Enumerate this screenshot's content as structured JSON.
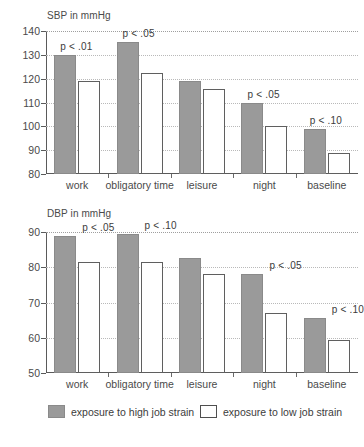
{
  "legend": {
    "high_label": "exposure to high job strain",
    "low_label": "exposure to low job strain",
    "high_color": "#9a9a9a",
    "low_color": "#ffffff",
    "position": "bottom"
  },
  "chart_data": [
    {
      "type": "bar",
      "title": "SBP in mmHg",
      "xlabel": "",
      "ylabel": "SBP in mmHg",
      "ylim": [
        80,
        140
      ],
      "yticks": [
        80,
        90,
        100,
        110,
        120,
        130,
        140
      ],
      "ytick_labels": [
        "80",
        "90",
        "100",
        "110",
        "120",
        "130",
        "140"
      ],
      "grid": true,
      "categories": [
        "work",
        "obligatory time",
        "leisure",
        "night",
        "baseline"
      ],
      "series": [
        {
          "name": "exposure to high job strain",
          "values": [
            130,
            135.5,
            119,
            110,
            99
          ]
        },
        {
          "name": "exposure to low job strain",
          "values": [
            119,
            122.5,
            115.5,
            100,
            89
          ]
        }
      ],
      "annotations": [
        {
          "category": "work",
          "text": "p < .01"
        },
        {
          "category": "obligatory time",
          "text": "p < .05"
        },
        {
          "category": "leisure",
          "text": ""
        },
        {
          "category": "night",
          "text": "p < .05"
        },
        {
          "category": "baseline",
          "text": "p < .10"
        }
      ]
    },
    {
      "type": "bar",
      "title": "DBP in mmHg",
      "xlabel": "",
      "ylabel": "DBP in mmHg",
      "ylim": [
        50,
        90
      ],
      "yticks": [
        50,
        60,
        70,
        80,
        90
      ],
      "ytick_labels": [
        "50",
        "60",
        "70",
        "80",
        "90"
      ],
      "grid": true,
      "categories": [
        "work",
        "obligatory time",
        "leisure",
        "night",
        "baseline"
      ],
      "series": [
        {
          "name": "exposure to high job strain",
          "values": [
            89,
            89.5,
            82.5,
            78,
            65.5
          ]
        },
        {
          "name": "exposure to low job strain",
          "values": [
            81.5,
            81.5,
            78,
            67,
            59.5
          ]
        }
      ],
      "annotations": [
        {
          "category": "work",
          "text": "p < .05"
        },
        {
          "category": "obligatory time",
          "text": "p < .10"
        },
        {
          "category": "leisure",
          "text": ""
        },
        {
          "category": "night",
          "text": "p < .05"
        },
        {
          "category": "baseline",
          "text": "p < .10"
        }
      ]
    }
  ]
}
